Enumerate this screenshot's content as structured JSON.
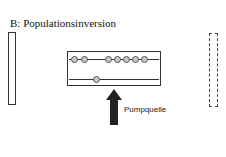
{
  "title": "B: Populationsinversion",
  "pump_label": "Pumpquelle",
  "upper_level_atoms": [
    0,
    1,
    3,
    4,
    5,
    6,
    7
  ],
  "lower_level_atoms": [
    2
  ],
  "colors": {
    "atom_fill": "#c8c8c8",
    "arrow": "#222222"
  }
}
